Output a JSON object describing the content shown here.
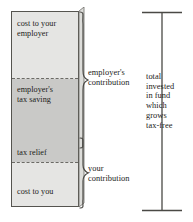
{
  "diagram": {
    "type": "stacked-bar-with-braces",
    "title_visible": false,
    "colors": {
      "light_fill": "#e5e5e3",
      "dark_fill": "#c9c9c7",
      "outline": "#55544f",
      "dashed_divider": "#6b6a65",
      "text": "#1c1b19",
      "background": "#ffffff"
    },
    "bar": {
      "segments": [
        {
          "id": "employer-cost",
          "label": "cost to your employer",
          "label_lines": [
            "cost to your",
            "employer"
          ],
          "fill": "light",
          "group": "employer's contribution"
        },
        {
          "id": "employer-tax-saving",
          "label": "employer's tax saving",
          "label_lines": [
            "employer's",
            "tax saving"
          ],
          "fill": "dark",
          "group": "employer's contribution"
        },
        {
          "id": "tax-relief",
          "label": "tax relief",
          "label_lines": [
            "tax relief"
          ],
          "fill": "dark",
          "group": "your contribution"
        },
        {
          "id": "cost-to-you",
          "label": "cost to you",
          "label_lines": [
            "cost to you"
          ],
          "fill": "light",
          "group": "your contribution"
        }
      ]
    },
    "braces": [
      {
        "id": "employer-contribution",
        "label": "employer's contribution",
        "label_lines": [
          "employer's",
          "contribution"
        ],
        "spans": [
          "employer-cost",
          "employer-tax-saving"
        ]
      },
      {
        "id": "your-contribution",
        "label": "your contribution",
        "label_lines": [
          "your",
          "contribution"
        ],
        "spans": [
          "tax-relief",
          "cost-to-you"
        ]
      }
    ],
    "total": {
      "label": "total invested in fund which grows tax-free",
      "label_lines": [
        "total",
        "invested",
        "in fund",
        "which",
        "grows",
        "tax-free"
      ],
      "marker": "dimension-line-with-end-caps"
    }
  }
}
